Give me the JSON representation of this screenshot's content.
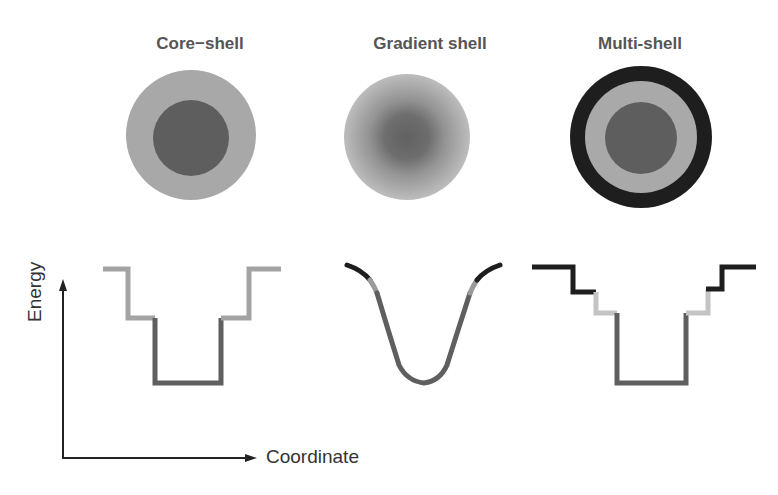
{
  "panels": [
    {
      "title": "Core−shell",
      "type": "core-shell"
    },
    {
      "title": "Gradient shell",
      "type": "gradient-shell"
    },
    {
      "title": "Multi-shell",
      "type": "multi-shell"
    }
  ],
  "axes": {
    "ylabel": "Energy",
    "xlabel": "Coordinate"
  },
  "colors": {
    "core": "#5e5e5e",
    "shell": "#a8a8a8",
    "outer_shell": "#1e1e1e",
    "light_shell": "#c4c4c4"
  }
}
